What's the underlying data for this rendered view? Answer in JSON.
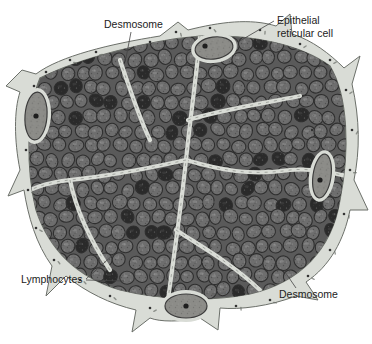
{
  "figure": {
    "colors": {
      "background": "#ffffff",
      "stroma": "#d9dcd6",
      "stroma_edge": "#6b6f69",
      "reticular_cell": "#8c8c88",
      "reticular_nucleolus": "#1e1e1e",
      "lymphocyte": "#6e6e6e",
      "lymphocyte_dark": "#2a2a2a",
      "lymphocyte_edge": "#2f2f2f",
      "cluster_bg": "#5a5a5a",
      "granule": "#333333"
    },
    "labels": [
      {
        "id": "desmosome-top",
        "text": "Desmosome"
      },
      {
        "id": "epithelial-reticular-cell",
        "lines": [
          "Epithelial",
          "reticular cell"
        ]
      },
      {
        "id": "lymphocytes",
        "text": "Lymphocytes"
      },
      {
        "id": "desmosome-bottom",
        "text": "Desmosome"
      }
    ],
    "signature": "Sheppard"
  }
}
